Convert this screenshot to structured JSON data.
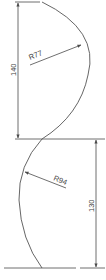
{
  "drawing": {
    "type": "technical-profile-drawing",
    "colors": {
      "line": "#4a4a4a",
      "background": "#ffffff"
    },
    "dimensions": [
      {
        "id": "upper-height",
        "label": "140",
        "orientation": "vertical",
        "side": "left"
      },
      {
        "id": "lower-height",
        "label": "130",
        "orientation": "vertical",
        "side": "right"
      }
    ],
    "radii": [
      {
        "id": "upper-arc-radius",
        "label": "R77"
      },
      {
        "id": "lower-arc-radius",
        "label": "R94"
      }
    ]
  }
}
